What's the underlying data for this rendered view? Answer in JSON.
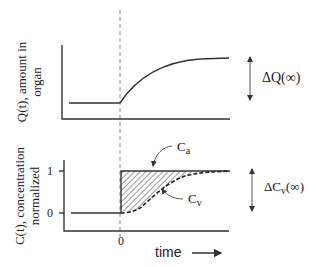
{
  "top_plot": {
    "ylabel_line1": "Q(t), amount in",
    "ylabel_line2": "organ",
    "delta_label": "ΔQ(∞)"
  },
  "bottom_plot": {
    "ylabel_line1": "C(t), concentration",
    "ylabel_line2": "normalized",
    "ytick_1": "1",
    "ytick_0": "0",
    "xtick_0": "0",
    "ca_label_main": "C",
    "ca_label_sub": "a",
    "cv_label_main": "C",
    "cv_label_sub": "v",
    "delta_label_main": "ΔC",
    "delta_label_sub": "v",
    "delta_label_tail": "(∞)"
  },
  "xaxis": {
    "label": "time"
  },
  "colors": {
    "line": "#333333",
    "dashed_marker": "#888888",
    "hatch": "#555555"
  }
}
